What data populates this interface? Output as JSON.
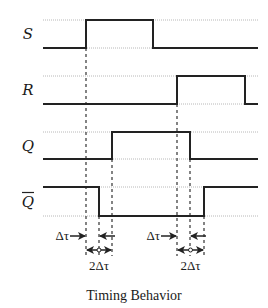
{
  "title": "Timing Behavior",
  "layout": {
    "x_start": 43,
    "x_end": 258
  },
  "signals": [
    {
      "name": "S",
      "label": "S",
      "overbar": false,
      "high_y": 20,
      "low_y": 48,
      "initial": "low",
      "transitions": [
        86,
        153
      ]
    },
    {
      "name": "R",
      "label": "R",
      "overbar": false,
      "high_y": 76,
      "low_y": 104,
      "initial": "low",
      "transitions": [
        177,
        245
      ]
    },
    {
      "name": "Q",
      "label": "Q",
      "overbar": false,
      "high_y": 132,
      "low_y": 159,
      "initial": "low",
      "transitions": [
        112,
        190
      ]
    },
    {
      "name": "Q_bar",
      "label": "Q",
      "overbar": true,
      "high_y": 187,
      "low_y": 216,
      "initial": "high",
      "transitions": [
        99,
        204
      ]
    }
  ],
  "guides": [
    {
      "x": 86,
      "y1": 48,
      "y2": 256
    },
    {
      "x": 99,
      "y1": 216,
      "y2": 256
    },
    {
      "x": 112,
      "y1": 159,
      "y2": 256
    },
    {
      "x": 177,
      "y1": 104,
      "y2": 256
    },
    {
      "x": 190,
      "y1": 159,
      "y2": 256
    },
    {
      "x": 204,
      "y1": 216,
      "y2": 256
    }
  ],
  "annotations": {
    "delay_label": "Δτ",
    "double_delay_label": "2Δτ",
    "delays": [
      {
        "text": "Δτ",
        "x_from": 86,
        "x_to": 99,
        "y": 236
      },
      {
        "text": "Δτ",
        "x_from": 177,
        "x_to": 190,
        "y": 236
      }
    ],
    "double_delays": [
      {
        "text": "2Δτ",
        "x_from": 86,
        "x_to": 112,
        "y": 250
      },
      {
        "text": "2Δτ",
        "x_from": 177,
        "x_to": 204,
        "y": 250
      }
    ]
  },
  "colors": {
    "ink": "#222222",
    "rail": "#b8b8b8",
    "background": "#ffffff"
  }
}
